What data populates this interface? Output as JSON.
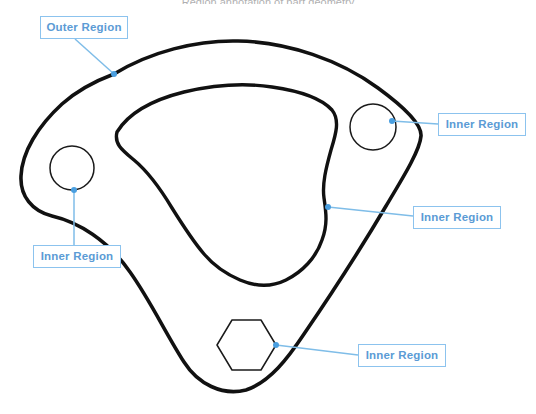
{
  "page": {
    "background_color": "#ffffff",
    "width": 536,
    "height": 414,
    "clipped_top_text": "Region annotation of part geometry"
  },
  "theme": {
    "geometry_stroke": "#111111",
    "hole_stroke": "#1a1a1a",
    "callout_border": "#8cc3ee",
    "callout_text": "#5b9bd5",
    "leader_line": "#7fbde8",
    "leader_dot": "#4a9fe0"
  },
  "callouts": [
    {
      "id": "outer-region",
      "label": "Outer Region",
      "box": {
        "x": 40,
        "y": 16,
        "width": 88,
        "height": 23
      },
      "anchor": {
        "x": 114,
        "y": 74
      },
      "leader": "M 75,39 L 114,74"
    },
    {
      "id": "inner-region-top-right",
      "label": "Inner Region",
      "box": {
        "x": 438,
        "y": 113,
        "width": 88,
        "height": 23
      },
      "anchor": {
        "x": 392,
        "y": 121
      },
      "leader": "M 438,124 L 392,121"
    },
    {
      "id": "inner-region-left",
      "label": "Inner Region",
      "box": {
        "x": 33,
        "y": 245,
        "width": 88,
        "height": 23
      },
      "anchor": {
        "x": 74,
        "y": 190
      },
      "leader": "M 74,245 L 74,190"
    },
    {
      "id": "inner-region-center",
      "label": "Inner Region",
      "box": {
        "x": 413,
        "y": 206,
        "width": 88,
        "height": 23
      },
      "anchor": {
        "x": 328,
        "y": 207
      },
      "leader": "M 413,216 L 328,207"
    },
    {
      "id": "inner-region-hex",
      "label": "Inner Region",
      "box": {
        "x": 358,
        "y": 344,
        "width": 88,
        "height": 23
      },
      "anchor": {
        "x": 276,
        "y": 345
      },
      "leader": "M 358,355 L 276,345"
    }
  ],
  "geometry": {
    "outer_boundary": {
      "name": "outer-region-boundary",
      "stroke_width": 3.6,
      "path": "M 114,74 C 150,52 196,40 238,41 C 288,42 340,60 378,88 C 404,107 422,124 421,136 C 420,150 404,176 386,206 C 360,250 330,296 304,334 C 288,358 270,382 246,390 C 222,396 198,384 184,362 C 166,334 150,300 130,272 C 108,240 78,222 52,216 C 32,211 20,196 21,176 C 22,152 38,126 62,104 C 80,88 98,80 114,74 Z"
    },
    "inner_cutout": {
      "name": "inner-region-cutout",
      "stroke_width": 3.4,
      "path": "M 117,132 C 128,114 152,100 184,92 C 214,85 246,83 272,87 C 300,91 322,99 332,110 C 340,120 336,134 331,150 C 326,168 322,184 324,198 C 326,212 328,224 322,240 C 316,258 302,272 286,280 C 270,288 254,286 240,280 C 226,274 214,266 204,254 C 192,240 182,224 172,208 C 160,188 146,170 134,160 C 122,150 114,144 117,132 Z"
    },
    "holes": [
      {
        "name": "hole-left-circle",
        "type": "circle",
        "cx": 72,
        "cy": 168,
        "r": 22,
        "stroke_width": 1.5
      },
      {
        "name": "hole-right-circle",
        "type": "circle",
        "cx": 373,
        "cy": 127,
        "r": 23,
        "stroke_width": 1.5
      },
      {
        "name": "hole-hexagon",
        "type": "hexagon",
        "points": "217,345 232,320 261,320 276,345 261,370 232,370",
        "stroke_width": 1.5
      }
    ]
  }
}
